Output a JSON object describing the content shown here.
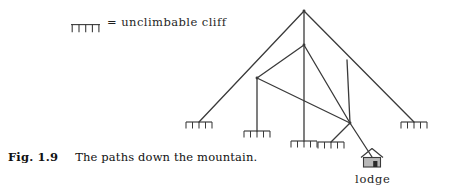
{
  "figure": {
    "number_label": "Fig. 1.9",
    "caption": "The paths down the mountain.",
    "legend": {
      "symbol_name": "unclimbable-cliff-symbol",
      "equals": "=",
      "text": "= unclimbable cliff",
      "meaning": "unclimbable cliff"
    },
    "lodge_label": "lodge",
    "colors": {
      "ink": "#3a3a3a",
      "text": "#1f1f1f",
      "background": "#ffffff",
      "lodge_wall": "#b8b8b8",
      "lodge_door": "#2a2a2a"
    }
  },
  "diagram": {
    "type": "node-link-graph",
    "nodes": [
      {
        "id": "summit",
        "name": "mountain-summit",
        "x": 304,
        "y": 11,
        "kind": "junction"
      },
      {
        "id": "mid",
        "name": "mid-junction",
        "x": 304,
        "y": 45,
        "kind": "junction"
      },
      {
        "id": "left",
        "name": "left-junction",
        "x": 257,
        "y": 78,
        "kind": "junction"
      },
      {
        "id": "rightspur",
        "name": "right-spur-top",
        "x": 347,
        "y": 60,
        "kind": "endpoint"
      },
      {
        "id": "lower",
        "name": "lower-junction",
        "x": 350,
        "y": 123,
        "kind": "junction"
      },
      {
        "id": "cliff1",
        "name": "cliff-far-left",
        "x": 199,
        "y": 122,
        "kind": "cliff"
      },
      {
        "id": "cliff2",
        "name": "cliff-left",
        "x": 257,
        "y": 131,
        "kind": "cliff"
      },
      {
        "id": "cliff3",
        "name": "cliff-center",
        "x": 304,
        "y": 141,
        "kind": "cliff"
      },
      {
        "id": "cliff4",
        "name": "cliff-right-center",
        "x": 331,
        "y": 142,
        "kind": "cliff"
      },
      {
        "id": "cliff5",
        "name": "cliff-far-right",
        "x": 414,
        "y": 122,
        "kind": "cliff"
      },
      {
        "id": "lodge",
        "name": "lodge",
        "x": 372,
        "y": 157,
        "kind": "lodge"
      }
    ],
    "edges": [
      {
        "from": "summit",
        "to": "cliff1",
        "name": "path-summit-to-far-left-cliff"
      },
      {
        "from": "summit",
        "to": "cliff5",
        "name": "path-summit-to-far-right-cliff"
      },
      {
        "from": "summit",
        "to": "mid",
        "name": "path-summit-to-mid"
      },
      {
        "from": "mid",
        "to": "left",
        "name": "path-mid-to-left-junction"
      },
      {
        "from": "mid",
        "to": "cliff3",
        "name": "path-mid-to-center-cliff"
      },
      {
        "from": "mid",
        "to": "lower",
        "name": "path-mid-to-lower-junction"
      },
      {
        "from": "left",
        "to": "cliff2",
        "name": "path-left-junction-to-left-cliff"
      },
      {
        "from": "left",
        "to": "lower",
        "name": "path-left-junction-to-lower-junction"
      },
      {
        "from": "rightspur",
        "to": "lower",
        "name": "path-right-spur-to-lower-junction"
      },
      {
        "from": "lower",
        "to": "cliff4",
        "name": "path-lower-junction-to-right-center-cliff"
      },
      {
        "from": "lower",
        "to": "lodge",
        "name": "path-lower-junction-to-lodge"
      }
    ],
    "cliff_marks": [
      {
        "name": "cliff-mark-far-left",
        "cx": 199,
        "y": 122,
        "width": 26,
        "teeth": 5
      },
      {
        "name": "cliff-mark-left",
        "cx": 257,
        "y": 131,
        "width": 26,
        "teeth": 5
      },
      {
        "name": "cliff-mark-center",
        "cx": 304,
        "y": 141,
        "width": 26,
        "teeth": 5
      },
      {
        "name": "cliff-mark-right-center",
        "cx": 331,
        "y": 142,
        "width": 26,
        "teeth": 5
      },
      {
        "name": "cliff-mark-far-right",
        "cx": 414,
        "y": 122,
        "width": 26,
        "teeth": 5
      }
    ]
  }
}
